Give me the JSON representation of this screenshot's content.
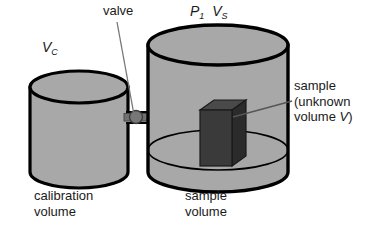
{
  "figure": {
    "kind": "pycnometer-schematic",
    "background_color": "#ffffff"
  },
  "colors": {
    "cylinder_fill": "#a8a8a8",
    "cylinder_top_fill": "#a8a8a8",
    "outline": "#000000",
    "sample_front": "#3a3a3a",
    "sample_top": "#4a4a4a",
    "sample_side": "#2b2b2b",
    "valve_body": "#707070",
    "leader_line": "#555555",
    "text": "#1a1a1a"
  },
  "labels": {
    "valve": "valve",
    "calibration_volume_symbol_base": "V",
    "calibration_volume_symbol_sub": "C",
    "sample_pressure_symbol_base": "P",
    "sample_pressure_symbol_sub": "1",
    "sample_volume_symbol_base": "V",
    "sample_volume_symbol_sub": "S",
    "sample_annotation_line1": "sample",
    "sample_annotation_line2": "(unknown",
    "sample_annotation_line3_prefix": "volume ",
    "sample_annotation_line3_symbol": "V",
    "sample_annotation_line3_suffix": ")",
    "calibration_caption_line1": "calibration",
    "calibration_caption_line2": "volume",
    "sample_caption_line1": "sample",
    "sample_caption_line2": "volume"
  },
  "geometry": {
    "calibration_cylinder": {
      "center_x": 79,
      "top_ellipse_cy": 87,
      "bottom_ellipse_cy": 172,
      "rx": 49,
      "ry": 16
    },
    "sample_cylinder": {
      "center_x": 218,
      "top_ellipse_cy": 45,
      "bottom_ellipse_cy": 172,
      "rx": 70,
      "ry": 20,
      "floor_ellipse_cy": 150
    },
    "valve": {
      "cx": 136,
      "cy": 117,
      "radius": 6
    },
    "sample_box": {
      "x": 200,
      "y": 110,
      "width": 32,
      "height": 56,
      "depth": 14
    }
  }
}
